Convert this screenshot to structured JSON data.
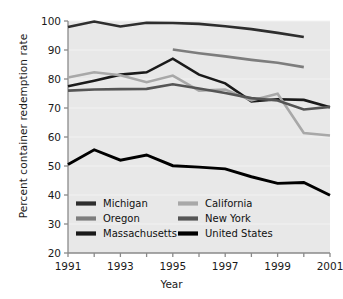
{
  "chart_data": {
    "type": "line",
    "title": "",
    "xlabel": "Year",
    "ylabel": "Percent container redemption rate",
    "xlim": [
      1991,
      2001
    ],
    "ylim": [
      20,
      100
    ],
    "grid": false,
    "legend_position": "inside-bottom-left",
    "x": [
      1991,
      1992,
      1993,
      1994,
      1995,
      1996,
      1997,
      1998,
      1999,
      2000,
      2001
    ],
    "xticks": [
      1991,
      1992,
      1993,
      1994,
      1995,
      1996,
      1997,
      1998,
      1999,
      2000,
      2001
    ],
    "xticklabels": [
      "1991",
      "",
      "1993",
      "",
      "1995",
      "",
      "1997",
      "",
      "1999",
      "",
      "2001"
    ],
    "yticks": [
      20,
      30,
      40,
      50,
      60,
      70,
      80,
      90,
      100
    ],
    "yticklabels": [
      "20",
      "30",
      "40",
      "50",
      "60",
      "70",
      "80",
      "90",
      "100"
    ],
    "series": [
      {
        "name": "Michigan",
        "color": "#2e2e2e",
        "width": 2.6,
        "x": [
          1991,
          1992,
          1993,
          1994,
          1995,
          1996,
          1997,
          1998,
          1999,
          2000
        ],
        "values": [
          97.9,
          99.8,
          98.1,
          99.4,
          99.3,
          99.0,
          98.2,
          97.2,
          95.9,
          94.5
        ]
      },
      {
        "name": "Oregon",
        "color": "#7d7d7d",
        "width": 2.6,
        "x": [
          1995,
          1996,
          1997,
          1998,
          1999,
          2000
        ],
        "values": [
          90.2,
          88.9,
          87.8,
          86.6,
          85.6,
          84.1
        ]
      },
      {
        "name": "Massachusetts",
        "color": "#1a1a1a",
        "width": 2.6,
        "x": [
          1991,
          1992,
          1993,
          1994,
          1995,
          1996,
          1997,
          1998,
          1999,
          2000,
          2001
        ],
        "values": [
          77.5,
          79.4,
          81.5,
          82.3,
          87.0,
          81.5,
          78.5,
          72.3,
          73.0,
          72.8,
          70.3
        ]
      },
      {
        "name": "California",
        "color": "#a8a8a8",
        "width": 2.6,
        "x": [
          1991,
          1992,
          1993,
          1994,
          1995,
          1996,
          1997,
          1998,
          1999,
          2000,
          2001
        ],
        "values": [
          80.5,
          82.3,
          81.3,
          78.9,
          81.2,
          76.0,
          76.4,
          72.6,
          74.9,
          61.4,
          60.5
        ]
      },
      {
        "name": "New York",
        "color": "#555555",
        "width": 2.6,
        "x": [
          1991,
          1992,
          1993,
          1994,
          1995,
          1996,
          1997,
          1998,
          1999,
          2000,
          2001
        ],
        "values": [
          76.0,
          76.4,
          76.5,
          76.6,
          78.2,
          76.7,
          75.2,
          73.4,
          72.6,
          69.5,
          70.4
        ]
      },
      {
        "name": "United States",
        "color": "#000000",
        "width": 2.9,
        "x": [
          1991,
          1992,
          1993,
          1994,
          1995,
          1996,
          1997,
          1998,
          1999,
          2000,
          2001
        ],
        "values": [
          50.5,
          55.6,
          52.0,
          53.8,
          50.1,
          49.6,
          49.0,
          46.3,
          44.0,
          44.3,
          39.9
        ]
      }
    ],
    "legend": [
      {
        "label": "Michigan",
        "color": "#2e2e2e"
      },
      {
        "label": "California",
        "color": "#a8a8a8"
      },
      {
        "label": "Oregon",
        "color": "#7d7d7d"
      },
      {
        "label": "New York",
        "color": "#555555"
      },
      {
        "label": "Massachusetts",
        "color": "#1a1a1a"
      },
      {
        "label": "United States",
        "color": "#000000"
      }
    ],
    "plot_background": "#e8e8e8",
    "axis_color": "#8a8a8a"
  }
}
